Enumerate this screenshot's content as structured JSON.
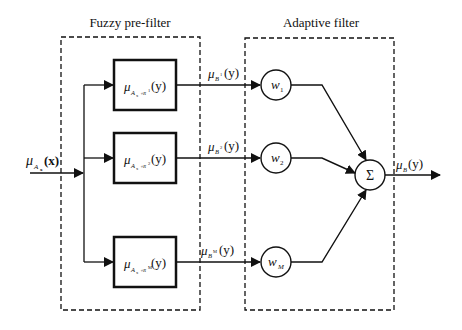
{
  "diagram": {
    "type": "block-diagram",
    "sections": [
      {
        "id": "prefilter",
        "title": "Fuzzy pre-filter"
      },
      {
        "id": "adaptive",
        "title": "Adaptive filter"
      }
    ],
    "input": {
      "label_mu": "μ",
      "label_sub": "A",
      "label_subsub": "x",
      "label_arg": "(x)"
    },
    "blocks": [
      {
        "mu": "μ",
        "sub": "A",
        "subsub": "x",
        "comp": "∘R",
        "sup": "1",
        "arg": "(y)"
      },
      {
        "mu": "μ",
        "sub": "A",
        "subsub": "x",
        "comp": "∘R",
        "sup": "2",
        "arg": "(y)"
      },
      {
        "mu": "μ",
        "sub": "A",
        "subsub": "x",
        "comp": "∘R",
        "sup": "M",
        "arg": "(y)"
      }
    ],
    "edges": [
      {
        "mu": "μ",
        "sub": "B",
        "sup": "1",
        "arg": "(y)"
      },
      {
        "mu": "μ",
        "sub": "B",
        "sup": "2",
        "arg": "(y)"
      },
      {
        "mu": "μ",
        "sub": "B",
        "sup": "M",
        "arg": "(y)"
      }
    ],
    "weights": [
      {
        "w": "w",
        "sub": "1"
      },
      {
        "w": "w",
        "sub": "2"
      },
      {
        "w": "w",
        "sub": "M"
      }
    ],
    "summer": {
      "symbol": "Σ"
    },
    "output": {
      "mu": "μ",
      "sub": "B",
      "arg": "(y)"
    }
  }
}
